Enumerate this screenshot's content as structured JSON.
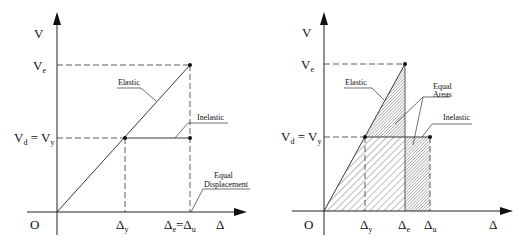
{
  "left": {
    "title": "Equal Displacement",
    "axis_y": "V",
    "axis_x": "Δ",
    "origin": "O",
    "ve_label": {
      "main": "V",
      "sub": "e"
    },
    "vd_label": {
      "main1": "V",
      "sub1": "d",
      "eq": " = ",
      "main2": "V",
      "sub2": "y"
    },
    "dy_label": {
      "main": "Δ",
      "sub": "y"
    },
    "de_label": {
      "main1": "Δ",
      "sub1": "e",
      "eq": "=",
      "main2": "Δ",
      "sub2": "u"
    },
    "elastic_label": "Elastic",
    "inelastic_label": "Inelastic",
    "equal_label": "Equal",
    "displacement_label": "Displacement"
  },
  "right": {
    "title": "Equal Areas",
    "axis_y": "V",
    "axis_x": "Δ",
    "origin": "O",
    "ve_label": {
      "main": "V",
      "sub": "e"
    },
    "vd_label": {
      "main1": "V",
      "sub1": "d",
      "eq": " = ",
      "main2": "V",
      "sub2": "y"
    },
    "dy_label": {
      "main": "Δ",
      "sub": "y"
    },
    "de_label": {
      "main": "Δ",
      "sub": "e"
    },
    "du_label": {
      "main": "Δ",
      "sub": "u"
    },
    "elastic_label": "Elastic",
    "inelastic_label": "Inelastic",
    "equal_label": "Equal",
    "areas_label": "Areas"
  },
  "colors": {
    "line": "#222222",
    "hatch_light": "#555555",
    "hatch_dense": "#444444"
  }
}
